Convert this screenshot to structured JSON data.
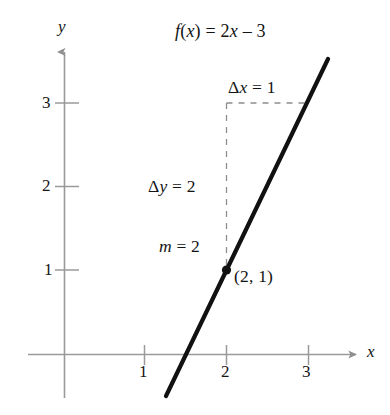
{
  "figure": {
    "axes": {
      "x_name": "x",
      "y_name": "y",
      "x_ticks": [
        "1",
        "2",
        "3"
      ],
      "y_ticks": [
        "1",
        "2",
        "3"
      ]
    },
    "annotations": {
      "equation": "f(x) = 2x – 3",
      "delta_x": "Δx = 1",
      "delta_y": "Δy = 2",
      "slope": "m = 2",
      "point": "(2, 1)"
    },
    "colors": {
      "axis": "#9a9a9a",
      "curve": "#111111",
      "dashed": "#8d8d8d",
      "text": "#131313",
      "background": "#ffffff"
    }
  },
  "chart_data": {
    "type": "line",
    "title": "f(x) = 2x – 3",
    "xlabel": "x",
    "ylabel": "y",
    "xlim": [
      -0.45,
      4.0
    ],
    "ylim": [
      -0.55,
      3.75
    ],
    "xticks": [
      1,
      2,
      3
    ],
    "yticks": [
      1,
      2,
      3
    ],
    "grid": false,
    "legend": null,
    "series": [
      {
        "name": "f(x) = 2x – 3",
        "slope": 2,
        "intercept": -3,
        "x": [
          0.72,
          2.68
        ],
        "y": [
          -1.56,
          2.36
        ]
      }
    ],
    "points": [
      {
        "label": "(2, 1)",
        "x": 2,
        "y": 1
      }
    ],
    "annotations": [
      {
        "text": "f(x) = 2x – 3",
        "x": 2.3,
        "y": 3.6
      },
      {
        "text": "Δx = 1",
        "x": 2.45,
        "y": 3.25
      },
      {
        "text": "Δy = 2",
        "x": 1.45,
        "y": 2.0
      },
      {
        "text": "m = 2",
        "x": 1.55,
        "y": 1.28
      },
      {
        "text": "(2, 1)",
        "x": 2.12,
        "y": 0.9
      }
    ],
    "guides": [
      {
        "type": "dashed-vertical",
        "x": 2,
        "y_from": 1,
        "y_to": 3
      },
      {
        "type": "dashed-horizontal",
        "y": 3,
        "x_from": 2,
        "x_to": 3
      }
    ]
  }
}
